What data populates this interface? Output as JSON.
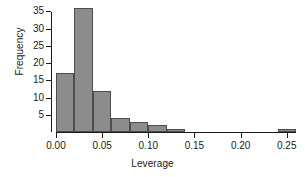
{
  "chart_data": {
    "type": "bar",
    "title": "",
    "subtitle": "",
    "xlabel": "Leverage",
    "ylabel": "Frequency",
    "xlim": [
      0.0,
      0.26
    ],
    "ylim": [
      0,
      36
    ],
    "grid": false,
    "legend": false,
    "bin_width": 0.02,
    "x_ticks": [
      {
        "value": 0.0,
        "label": "0.00"
      },
      {
        "value": 0.05,
        "label": "0.05"
      },
      {
        "value": 0.1,
        "label": "0.10"
      },
      {
        "value": 0.15,
        "label": "0.15"
      },
      {
        "value": 0.2,
        "label": "0.20"
      },
      {
        "value": 0.25,
        "label": "0.25"
      }
    ],
    "y_ticks": [
      {
        "value": 5,
        "label": "5"
      },
      {
        "value": 10,
        "label": "10"
      },
      {
        "value": 15,
        "label": "15"
      },
      {
        "value": 20,
        "label": "20"
      },
      {
        "value": 25,
        "label": "25"
      },
      {
        "value": 30,
        "label": "30"
      },
      {
        "value": 35,
        "label": "35"
      }
    ],
    "bins": [
      {
        "x0": 0.0,
        "x1": 0.02,
        "value": 17
      },
      {
        "x0": 0.02,
        "x1": 0.04,
        "value": 36
      },
      {
        "x0": 0.04,
        "x1": 0.06,
        "value": 12
      },
      {
        "x0": 0.06,
        "x1": 0.08,
        "value": 4
      },
      {
        "x0": 0.08,
        "x1": 0.1,
        "value": 3
      },
      {
        "x0": 0.1,
        "x1": 0.12,
        "value": 2
      },
      {
        "x0": 0.12,
        "x1": 0.14,
        "value": 1
      },
      {
        "x0": 0.24,
        "x1": 0.26,
        "value": 1
      }
    ],
    "categories": [
      "0.00-0.02",
      "0.02-0.04",
      "0.04-0.06",
      "0.06-0.08",
      "0.08-0.10",
      "0.10-0.12",
      "0.12-0.14",
      "0.24-0.26"
    ],
    "values": [
      17,
      36,
      12,
      4,
      3,
      2,
      1,
      1
    ],
    "colors": {
      "bar_fill": "#8c8c8c",
      "bar_border": "#4d4d4d",
      "axis": "#1a1a1a",
      "text": "#1a1a1a",
      "background": "#ffffff"
    }
  }
}
